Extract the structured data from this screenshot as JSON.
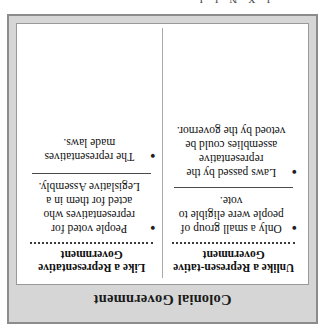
{
  "page": {
    "cut_off_top_text": "I X N I J"
  },
  "figure": {
    "title": "Colonial Government",
    "bullet_glyph": "●",
    "columns": [
      {
        "header": "Like a Representative Government",
        "bullets": [
          "People voted for representatives who acted for them in a Legislative Assembly.",
          "The representatives made laws."
        ]
      },
      {
        "header": "Unlike a Represen-tative Government",
        "bullets": [
          "Only a small group of people were eligible to vote.",
          "Laws passed by the representative assemblies could be vetoed by the governor."
        ]
      }
    ]
  }
}
